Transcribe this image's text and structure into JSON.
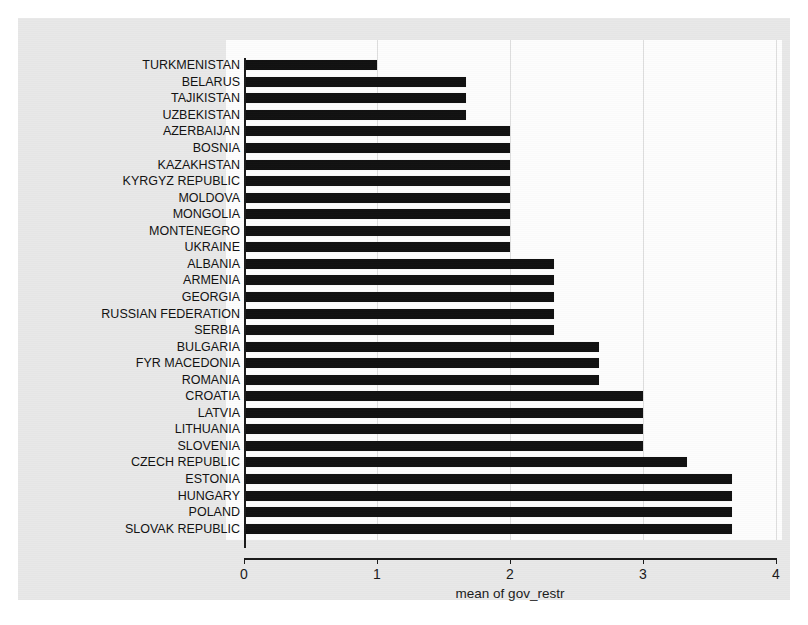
{
  "chart": {
    "xlabel": "mean of gov_restr",
    "ylabel": "",
    "title": ""
  },
  "chart_data": {
    "type": "bar",
    "orientation": "horizontal",
    "title": "",
    "xlabel": "mean of gov_restr",
    "ylabel": "",
    "xlim": [
      0,
      4
    ],
    "xticks": [
      0,
      1,
      2,
      3,
      4
    ],
    "xtick_labels": [
      "0",
      "1",
      "2",
      "3",
      "4"
    ],
    "grid": "vertical",
    "legend": "none",
    "bar_color": "#111111",
    "categories": [
      "TURKMENISTAN",
      "BELARUS",
      "TAJIKISTAN",
      "UZBEKISTAN",
      "AZERBAIJAN",
      "BOSNIA",
      "KAZAKHSTAN",
      "KYRGYZ REPUBLIC",
      "MOLDOVA",
      "MONGOLIA",
      "MONTENEGRO",
      "UKRAINE",
      "ALBANIA",
      "ARMENIA",
      "GEORGIA",
      "RUSSIAN FEDERATION",
      "SERBIA",
      "BULGARIA",
      "FYR MACEDONIA",
      "ROMANIA",
      "CROATIA",
      "LATVIA",
      "LITHUANIA",
      "SLOVENIA",
      "CZECH REPUBLIC",
      "ESTONIA",
      "HUNGARY",
      "POLAND",
      "SLOVAK REPUBLIC"
    ],
    "values": [
      1.0,
      1.67,
      1.67,
      1.67,
      2.0,
      2.0,
      2.0,
      2.0,
      2.0,
      2.0,
      2.0,
      2.0,
      2.33,
      2.33,
      2.33,
      2.33,
      2.33,
      2.67,
      2.67,
      2.67,
      3.0,
      3.0,
      3.0,
      3.0,
      3.33,
      3.67,
      3.67,
      3.67,
      3.67
    ]
  }
}
